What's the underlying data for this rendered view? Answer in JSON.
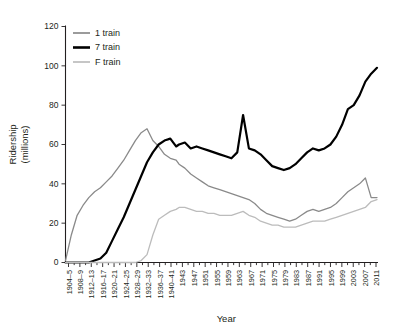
{
  "chart_data": {
    "type": "line",
    "title": "",
    "xlabel": "Year",
    "ylabel": "Ridership\n(millions)",
    "ylabel_line1": "Ridership",
    "ylabel_line2": "(millions)",
    "ylim": [
      0,
      120
    ],
    "yticks": [
      0,
      20,
      40,
      60,
      80,
      100,
      120
    ],
    "grid": false,
    "legend_position": "top-left-inside",
    "xtick_labels": [
      "1904–5",
      "1908–9",
      "1912–13",
      "1916–17",
      "1920–21",
      "1924–25",
      "1928–29",
      "1932–33",
      "1936–37",
      "1940–41",
      "1943",
      "1947",
      "1951",
      "1955",
      "1959",
      "1963",
      "1967",
      "1971",
      "1975",
      "1979",
      "1983",
      "1987",
      "1991",
      "1995",
      "1999",
      "2003",
      "2007",
      "2011"
    ],
    "x": [
      1904,
      1906,
      1908,
      1910,
      1912,
      1914,
      1916,
      1918,
      1920,
      1922,
      1924,
      1926,
      1928,
      1930,
      1932,
      1934,
      1936,
      1938,
      1940,
      1942,
      1943,
      1945,
      1947,
      1949,
      1951,
      1953,
      1955,
      1957,
      1959,
      1961,
      1963,
      1965,
      1967,
      1969,
      1971,
      1973,
      1975,
      1977,
      1979,
      1981,
      1983,
      1985,
      1987,
      1989,
      1991,
      1993,
      1995,
      1997,
      1999,
      2001,
      2003,
      2005,
      2007,
      2009,
      2011
    ],
    "series": [
      {
        "name": "1 train",
        "color": "#8a8a8a",
        "width": 1.3,
        "values": [
          1,
          14,
          24,
          29,
          33,
          36,
          38,
          41,
          44,
          48,
          52,
          57,
          62,
          66,
          68,
          62,
          59,
          55,
          53,
          52,
          50,
          48,
          45,
          43,
          41,
          39,
          38,
          37,
          36,
          35,
          34,
          33,
          32,
          30,
          27,
          25,
          24,
          23,
          22,
          21,
          22,
          24,
          26,
          27,
          26,
          27,
          28,
          30,
          33,
          36,
          38,
          40,
          43,
          33,
          33
        ]
      },
      {
        "name": "7 train",
        "color": "#000000",
        "width": 2.2,
        "values": [
          0,
          0,
          0,
          0,
          0,
          1,
          2,
          5,
          11,
          17,
          23,
          30,
          37,
          44,
          51,
          56,
          60,
          62,
          63,
          59,
          60,
          61,
          58,
          59,
          58,
          57,
          56,
          55,
          54,
          53,
          56,
          75,
          58,
          57,
          55,
          52,
          49,
          48,
          47,
          48,
          50,
          53,
          56,
          58,
          57,
          58,
          60,
          64,
          70,
          78,
          80,
          85,
          92,
          96,
          99
        ]
      },
      {
        "name": "F train",
        "color": "#bcbcbc",
        "width": 1.3,
        "values": [
          0,
          0,
          0,
          0,
          0,
          0,
          0,
          0,
          0,
          0,
          0,
          0,
          0,
          1,
          4,
          14,
          22,
          24,
          26,
          27,
          28,
          28,
          27,
          26,
          26,
          25,
          25,
          24,
          24,
          24,
          25,
          26,
          24,
          23,
          21,
          20,
          19,
          19,
          18,
          18,
          18,
          19,
          20,
          21,
          21,
          21,
          22,
          23,
          24,
          25,
          26,
          27,
          28,
          31,
          32
        ]
      }
    ]
  },
  "legend": {
    "items": [
      {
        "label": "1 train"
      },
      {
        "label": "7 train"
      },
      {
        "label": "F train"
      }
    ]
  },
  "axes": {
    "x_title": "Year",
    "y_title_line1": "Ridership",
    "y_title_line2": "(millions)"
  }
}
